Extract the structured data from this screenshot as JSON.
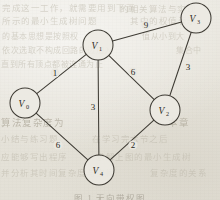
{
  "figure": {
    "caption": "图 1  无向带权图",
    "background_color": "#e8e6df",
    "ink_color": "#3e3b34"
  },
  "chart_data": {
    "type": "diagram",
    "diagram_kind": "undirected-weighted-graph",
    "title": "",
    "nodes": [
      {
        "id": "V0",
        "label": "V",
        "subscript": "0",
        "x": 25,
        "y": 103,
        "r": 15
      },
      {
        "id": "V1",
        "label": "V",
        "subscript": "1",
        "x": 98,
        "y": 45,
        "r": 15
      },
      {
        "id": "V2",
        "label": "V",
        "subscript": "2",
        "x": 165,
        "y": 110,
        "r": 15
      },
      {
        "id": "V3",
        "label": "V",
        "subscript": "3",
        "x": 196,
        "y": 18,
        "r": 15
      },
      {
        "id": "V4",
        "label": "V",
        "subscript": "4",
        "x": 99,
        "y": 170,
        "r": 15
      }
    ],
    "edges": [
      {
        "source": "V0",
        "target": "V1",
        "weight": "1",
        "label_x": 55,
        "label_y": 76
      },
      {
        "source": "V1",
        "target": "V3",
        "weight": "9",
        "label_x": 146,
        "label_y": 28
      },
      {
        "source": "V1",
        "target": "V2",
        "weight": "6",
        "label_x": 133,
        "label_y": 75
      },
      {
        "source": "V1",
        "target": "V4",
        "weight": "3",
        "label_x": 93,
        "label_y": 110
      },
      {
        "source": "V3",
        "target": "V2",
        "weight": "3",
        "label_x": 188,
        "label_y": 70
      },
      {
        "source": "V0",
        "target": "V4",
        "weight": "6",
        "label_x": 58,
        "label_y": 148
      },
      {
        "source": "V2",
        "target": "V4",
        "weight": "2",
        "label_x": 133,
        "label_y": 148
      }
    ],
    "legend": [],
    "xlabel": "",
    "ylabel": ""
  },
  "bleedthrough": [
    {
      "text": "完成这一工作，就需要用到下面",
      "x": 2,
      "y": 1,
      "size": 8.5,
      "strong": false
    },
    {
      "text": "的相关算法与实现",
      "x": 120,
      "y": 2,
      "size": 8.5,
      "strong": false
    },
    {
      "text": "所示的最小生成树问题",
      "x": 2,
      "y": 14,
      "size": 8.5,
      "strong": false
    },
    {
      "text": "其中的权值表示",
      "x": 130,
      "y": 14,
      "size": 8.5,
      "strong": false
    },
    {
      "text": "的基本思想是按照权",
      "x": 2,
      "y": 30,
      "size": 8,
      "strong": false
    },
    {
      "text": "值从小到大",
      "x": 142,
      "y": 30,
      "size": 8,
      "strong": false
    },
    {
      "text": "依次选取不构成回路的边加入",
      "x": 2,
      "y": 44,
      "size": 8,
      "strong": false
    },
    {
      "text": "集合中",
      "x": 176,
      "y": 44,
      "size": 8,
      "strong": false
    },
    {
      "text": "直到所有顶点都被连通为止",
      "x": 1,
      "y": 58,
      "size": 8,
      "strong": false
    },
    {
      "text": "算法复杂度为",
      "x": 1,
      "y": 115,
      "size": 9.5,
      "strong": true
    },
    {
      "text": "本章",
      "x": 168,
      "y": 115,
      "size": 9.5,
      "strong": true
    },
    {
      "text": "小结与练习题",
      "x": 1,
      "y": 132,
      "size": 8.5,
      "strong": false
    },
    {
      "text": "在学习完本节之后",
      "x": 92,
      "y": 132,
      "size": 8.5,
      "strong": false
    },
    {
      "text": "应能够写出程序",
      "x": 1,
      "y": 150,
      "size": 8.5,
      "strong": false
    },
    {
      "text": "求解上图的最小生成树",
      "x": 96,
      "y": 150,
      "size": 8.5,
      "strong": false
    },
    {
      "text": "并分析其时间复杂度与空间",
      "x": 1,
      "y": 166,
      "size": 8.5,
      "strong": false
    },
    {
      "text": "复杂度的关系",
      "x": 150,
      "y": 166,
      "size": 8.5,
      "strong": false
    }
  ]
}
